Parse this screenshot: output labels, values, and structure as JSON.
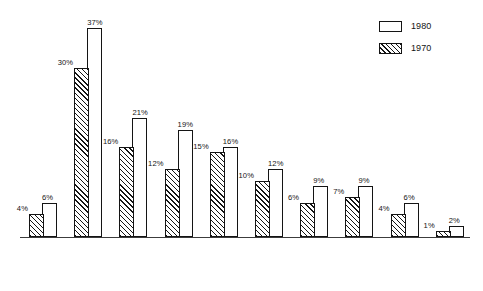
{
  "legend": {
    "position": "top-right",
    "entries": [
      {
        "label": "1980",
        "style": "open"
      },
      {
        "label": "1970",
        "style": "hatched"
      }
    ]
  },
  "chart_data": {
    "type": "bar",
    "title": "",
    "subtitle": "",
    "xlabel": "",
    "ylabel": "",
    "ylim": [
      0,
      38
    ],
    "grid": false,
    "legend_position": "top-right",
    "value_suffix": "%",
    "categories": [
      "United States",
      "New Mexico",
      "Texas",
      "California",
      "Arizona",
      "Colorado",
      "Florida",
      "New York",
      "Illinois",
      "Remainder of the United States"
    ],
    "category_lines": [
      [
        "United",
        "States"
      ],
      [
        "New",
        "Mexico"
      ],
      [
        "Texas"
      ],
      [
        "Cali-",
        "fornia"
      ],
      [
        "Arizona"
      ],
      [
        "Colorado"
      ],
      [
        "Florida"
      ],
      [
        "New",
        "York"
      ],
      [
        "Illinois"
      ],
      [
        "Remainder",
        "of the",
        "United States"
      ]
    ],
    "series": [
      {
        "name": "1970",
        "style": "hatched",
        "values": [
          4,
          30,
          16,
          12,
          15,
          10,
          6,
          7,
          4,
          1
        ]
      },
      {
        "name": "1980",
        "style": "open",
        "values": [
          6,
          37,
          21,
          19,
          16,
          12,
          9,
          9,
          6,
          2
        ]
      }
    ],
    "value_labels": {
      "1970": [
        "4%",
        "30%",
        "16%",
        "12%",
        "15%",
        "10%",
        "6%",
        "7%",
        "4%",
        "1%"
      ],
      "1980": [
        "6%",
        "37%",
        "21%",
        "19%",
        "16%",
        "12%",
        "9%",
        "9%",
        "6%",
        "2%"
      ]
    }
  },
  "colors": {
    "ink": "#141414",
    "axis": "#3c3c3c",
    "background": "#ffffff"
  }
}
